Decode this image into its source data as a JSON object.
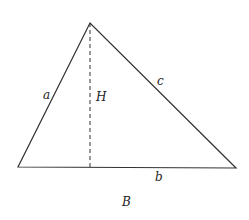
{
  "diagram": {
    "type": "triangle-with-altitude",
    "labels": {
      "side_left": "a",
      "side_right": "c",
      "side_bottom": "b",
      "altitude": "H",
      "caption": "B"
    },
    "vertices": {
      "apex": [
        90,
        23
      ],
      "left": [
        18,
        167
      ],
      "right": [
        236,
        168
      ]
    },
    "altitude_foot": [
      90,
      167
    ],
    "colors": {
      "stroke": "#333333",
      "background": "#ffffff"
    }
  }
}
